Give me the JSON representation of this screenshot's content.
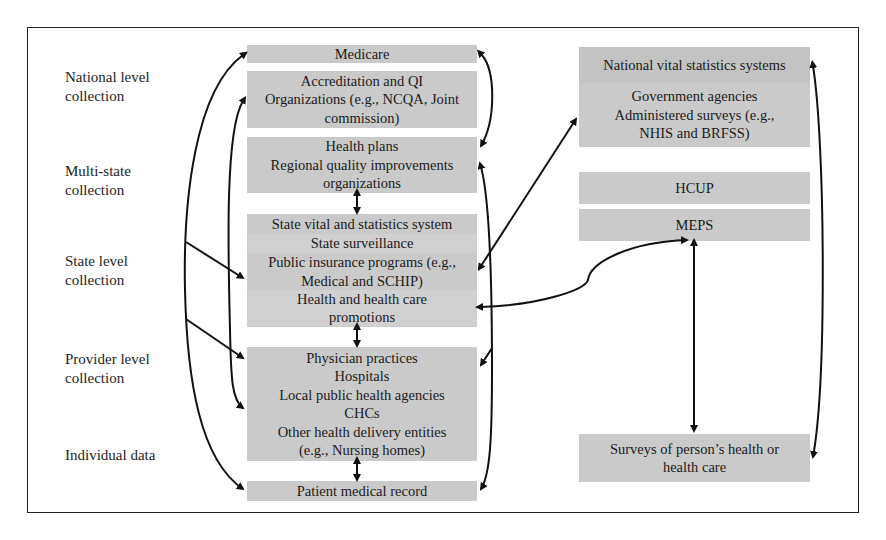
{
  "diagram": {
    "level_labels": [
      {
        "id": "national",
        "lines": [
          "National level",
          "collection"
        ]
      },
      {
        "id": "multistate",
        "lines": [
          "Multi-state",
          "collection"
        ]
      },
      {
        "id": "state",
        "lines": [
          "State level",
          "collection"
        ]
      },
      {
        "id": "provider",
        "lines": [
          "Provider level",
          "collection"
        ]
      },
      {
        "id": "individual",
        "lines": [
          "Individual data"
        ]
      }
    ],
    "middle_column": {
      "medicare": {
        "lines": [
          "Medicare"
        ]
      },
      "accreditation": {
        "lines": [
          "Accreditation and QI",
          "Organizations (e.g., NCQA, Joint",
          "commission)"
        ]
      },
      "health_plans": {
        "lines": [
          "Health plans",
          "Regional quality improvements",
          "organizations"
        ]
      },
      "state": {
        "bands": [
          {
            "lines": [
              "State vital and statistics system"
            ]
          },
          {
            "lines": [
              "State surveillance"
            ]
          },
          {
            "lines": [
              "Public insurance programs (e.g.,",
              "Medical and SCHIP)"
            ]
          },
          {
            "lines": [
              "Health and health care",
              "promotions"
            ]
          }
        ]
      },
      "provider": {
        "lines": [
          "Physician practices",
          "Hospitals",
          "Local public health agencies",
          "CHCs",
          "Other health delivery entities",
          "(e.g., Nursing homes)"
        ]
      },
      "patient_record": {
        "lines": [
          "Patient medical record"
        ]
      }
    },
    "right_column": {
      "national_vital": {
        "lines": [
          "National vital statistics systems"
        ]
      },
      "government": {
        "lines": [
          "Government agencies",
          "Administered surveys (e.g.,",
          "NHIS and BRFSS)"
        ]
      },
      "hcup": {
        "lines": [
          "HCUP"
        ]
      },
      "meps": {
        "lines": [
          "MEPS"
        ]
      },
      "surveys": {
        "lines": [
          "Surveys of person’s health or",
          "health care"
        ]
      }
    },
    "colors": {
      "box_fill": "#cacaca",
      "arrow": "#111111",
      "frame": "#222222"
    }
  }
}
